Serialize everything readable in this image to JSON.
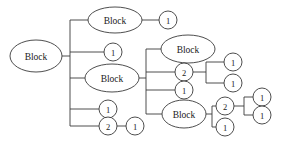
{
  "diagram": {
    "type": "tree",
    "orientation": "left-to-right",
    "style": {
      "line_color": "#3a3a3a",
      "node_fill": "#ffffff",
      "text_color": "#1a1a1a",
      "background": "#ffffff"
    },
    "nodes": [
      {
        "id": "n1",
        "label": "Block",
        "shape": "ellipse",
        "cx": 36,
        "cy": 56,
        "rx": 26,
        "ry": 16
      },
      {
        "id": "n2",
        "label": "Block",
        "shape": "ellipse",
        "cx": 115,
        "cy": 20,
        "rx": 27,
        "ry": 13
      },
      {
        "id": "n3",
        "label": "1",
        "shape": "circle",
        "cx": 168,
        "cy": 20,
        "rx": 9,
        "ry": 9
      },
      {
        "id": "n4",
        "label": "1",
        "shape": "circle",
        "cx": 113,
        "cy": 52,
        "rx": 9,
        "ry": 9
      },
      {
        "id": "n5",
        "label": "Block",
        "shape": "ellipse",
        "cx": 112,
        "cy": 78,
        "rx": 27,
        "ry": 14
      },
      {
        "id": "n6",
        "label": "Block",
        "shape": "ellipse",
        "cx": 188,
        "cy": 49,
        "rx": 27,
        "ry": 14
      },
      {
        "id": "n7",
        "label": "2",
        "shape": "circle",
        "cx": 184,
        "cy": 72,
        "rx": 9,
        "ry": 9
      },
      {
        "id": "n8",
        "label": "1",
        "shape": "circle",
        "cx": 233,
        "cy": 62,
        "rx": 9,
        "ry": 9
      },
      {
        "id": "n9",
        "label": "1",
        "shape": "circle",
        "cx": 233,
        "cy": 83,
        "rx": 9,
        "ry": 9
      },
      {
        "id": "n10",
        "label": "1",
        "shape": "circle",
        "cx": 184,
        "cy": 90,
        "rx": 9,
        "ry": 9
      },
      {
        "id": "n11",
        "label": "Block",
        "shape": "ellipse",
        "cx": 184,
        "cy": 114,
        "rx": 22,
        "ry": 14
      },
      {
        "id": "n12",
        "label": "2",
        "shape": "circle",
        "cx": 225,
        "cy": 106,
        "rx": 9,
        "ry": 9
      },
      {
        "id": "n13",
        "label": "1",
        "shape": "circle",
        "cx": 262,
        "cy": 97,
        "rx": 9,
        "ry": 9
      },
      {
        "id": "n14",
        "label": "1",
        "shape": "circle",
        "cx": 262,
        "cy": 115,
        "rx": 9,
        "ry": 9
      },
      {
        "id": "n15",
        "label": "1",
        "shape": "circle",
        "cx": 225,
        "cy": 127,
        "rx": 9,
        "ry": 9
      },
      {
        "id": "n16",
        "label": "1",
        "shape": "circle",
        "cx": 108,
        "cy": 109,
        "rx": 9,
        "ry": 9
      },
      {
        "id": "n17",
        "label": "2",
        "shape": "circle",
        "cx": 108,
        "cy": 126,
        "rx": 9,
        "ry": 9
      },
      {
        "id": "n18",
        "label": "1",
        "shape": "circle",
        "cx": 135,
        "cy": 126,
        "rx": 9,
        "ry": 9
      }
    ],
    "edges": [
      {
        "from": "n1",
        "to": "bus1",
        "path": "M 62 56 L 70 56"
      },
      {
        "from": "bus1",
        "to": "n2",
        "path": "M 70 20 L 88 20"
      },
      {
        "from": "bus1",
        "to": "n4",
        "path": "M 70 52 L 104 52"
      },
      {
        "from": "bus1",
        "to": "n5",
        "path": "M 70 78 L 85 78"
      },
      {
        "from": "bus1",
        "to": "n16",
        "path": "M 70 109 L 99 109"
      },
      {
        "from": "bus1",
        "to": "n17",
        "path": "M 70 126 L 99 126"
      },
      {
        "from": "bus1",
        "to": "bus1-spine",
        "path": "M 70 20 L 70 126"
      },
      {
        "from": "n2",
        "to": "n3",
        "path": "M 142 20 L 159 20"
      },
      {
        "from": "n5",
        "to": "bus2",
        "path": "M 139 78 L 146 78"
      },
      {
        "from": "bus2",
        "to": "n6",
        "path": "M 146 49 L 161 49"
      },
      {
        "from": "bus2",
        "to": "n7",
        "path": "M 146 72 L 175 72"
      },
      {
        "from": "bus2",
        "to": "n10",
        "path": "M 146 90 L 175 90"
      },
      {
        "from": "bus2",
        "to": "n11",
        "path": "M 146 114 L 162 114"
      },
      {
        "from": "bus2",
        "to": "bus2-spine",
        "path": "M 146 49 L 146 114"
      },
      {
        "from": "n7",
        "to": "bus3",
        "path": "M 193 72 L 206 72"
      },
      {
        "from": "bus3",
        "to": "n8",
        "path": "M 206 62 L 224 62"
      },
      {
        "from": "bus3",
        "to": "n9",
        "path": "M 206 83 L 224 83"
      },
      {
        "from": "bus3",
        "to": "bus3-spine",
        "path": "M 206 62 L 206 83"
      },
      {
        "from": "n11",
        "to": "bus4",
        "path": "M 206 114 L 212 114"
      },
      {
        "from": "bus4",
        "to": "n12",
        "path": "M 212 106 L 216 106"
      },
      {
        "from": "bus4",
        "to": "n15",
        "path": "M 212 127 L 216 127"
      },
      {
        "from": "bus4",
        "to": "bus4-spine",
        "path": "M 212 106 L 212 127"
      },
      {
        "from": "n12",
        "to": "bus5",
        "path": "M 234 106 L 244 106"
      },
      {
        "from": "bus5",
        "to": "n13",
        "path": "M 244 97 L 253 97"
      },
      {
        "from": "bus5",
        "to": "n14",
        "path": "M 244 115 L 253 115"
      },
      {
        "from": "bus5",
        "to": "bus5-spine",
        "path": "M 244 97 L 244 115"
      },
      {
        "from": "n17",
        "to": "n18",
        "path": "M 117 126 L 126 126"
      }
    ]
  }
}
